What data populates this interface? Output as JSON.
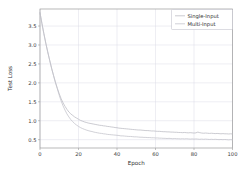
{
  "chart_data": {
    "type": "line",
    "title": "",
    "xlabel": "Epoch",
    "ylabel": "Test Loss",
    "xlim": [
      0,
      100
    ],
    "ylim": [
      0.28,
      3.95
    ],
    "xticks": [
      0,
      20,
      40,
      60,
      80,
      100
    ],
    "xticklabels": [
      "0",
      "20",
      "40",
      "60",
      "80",
      "100"
    ],
    "yticks": [
      0.5,
      1.0,
      1.5,
      2.0,
      2.5,
      3.0,
      3.5
    ],
    "yticklabels": [
      "0.5",
      "1.0",
      "1.5",
      "2.0",
      "2.5",
      "3.0",
      "3.5"
    ],
    "grid": true,
    "legend_position": "upper right",
    "legend_entries": [
      "Single-Input",
      "Multi-Input"
    ],
    "x": [
      0,
      1,
      2,
      3,
      4,
      5,
      6,
      7,
      8,
      9,
      10,
      11,
      12,
      13,
      14,
      15,
      16,
      17,
      18,
      19,
      20,
      21,
      22,
      23,
      24,
      25,
      26,
      27,
      28,
      29,
      30,
      31,
      32,
      33,
      34,
      35,
      36,
      37,
      38,
      39,
      40,
      41,
      42,
      43,
      44,
      45,
      46,
      47,
      48,
      49,
      50,
      51,
      52,
      53,
      54,
      55,
      56,
      57,
      58,
      59,
      60,
      61,
      62,
      63,
      64,
      65,
      66,
      67,
      68,
      69,
      70,
      71,
      72,
      73,
      74,
      75,
      76,
      77,
      78,
      79,
      80,
      81,
      82,
      83,
      84,
      85,
      86,
      87,
      88,
      89,
      90,
      91,
      92,
      93,
      94,
      95,
      96,
      97,
      98,
      99,
      100
    ],
    "series": [
      {
        "name": "Single-Input",
        "color": "#b9b9c2",
        "values": [
          3.85,
          3.57,
          3.3,
          3.05,
          2.82,
          2.6,
          2.39,
          2.2,
          2.02,
          1.86,
          1.71,
          1.58,
          1.47,
          1.38,
          1.3,
          1.23,
          1.18,
          1.14,
          1.1,
          1.07,
          1.04,
          1.01,
          0.99,
          0.97,
          0.955,
          0.94,
          0.93,
          0.92,
          0.91,
          0.9,
          0.89,
          0.88,
          0.875,
          0.865,
          0.86,
          0.85,
          0.845,
          0.835,
          0.83,
          0.82,
          0.815,
          0.805,
          0.8,
          0.795,
          0.79,
          0.785,
          0.78,
          0.775,
          0.77,
          0.765,
          0.76,
          0.755,
          0.755,
          0.75,
          0.745,
          0.74,
          0.74,
          0.735,
          0.73,
          0.73,
          0.725,
          0.72,
          0.72,
          0.715,
          0.71,
          0.71,
          0.705,
          0.705,
          0.7,
          0.7,
          0.695,
          0.695,
          0.69,
          0.69,
          0.685,
          0.69,
          0.685,
          0.68,
          0.685,
          0.68,
          0.675,
          0.68,
          0.7,
          0.685,
          0.675,
          0.67,
          0.675,
          0.67,
          0.665,
          0.67,
          0.665,
          0.66,
          0.665,
          0.66,
          0.655,
          0.66,
          0.655,
          0.655,
          0.65,
          0.655,
          0.65
        ]
      },
      {
        "name": "Multi-Input",
        "color": "#c2c2c9",
        "values": [
          3.85,
          3.57,
          3.3,
          3.05,
          2.82,
          2.6,
          2.39,
          2.2,
          2.01,
          1.84,
          1.67,
          1.52,
          1.39,
          1.28,
          1.18,
          1.1,
          1.03,
          0.975,
          0.925,
          0.885,
          0.85,
          0.82,
          0.795,
          0.775,
          0.755,
          0.74,
          0.725,
          0.715,
          0.7,
          0.69,
          0.68,
          0.67,
          0.665,
          0.655,
          0.65,
          0.64,
          0.635,
          0.63,
          0.625,
          0.62,
          0.615,
          0.61,
          0.6,
          0.6,
          0.595,
          0.59,
          0.585,
          0.585,
          0.58,
          0.575,
          0.575,
          0.57,
          0.565,
          0.565,
          0.56,
          0.56,
          0.555,
          0.555,
          0.55,
          0.55,
          0.545,
          0.545,
          0.54,
          0.54,
          0.535,
          0.535,
          0.53,
          0.535,
          0.53,
          0.525,
          0.53,
          0.525,
          0.525,
          0.52,
          0.525,
          0.52,
          0.525,
          0.52,
          0.515,
          0.52,
          0.515,
          0.52,
          0.515,
          0.51,
          0.515,
          0.51,
          0.515,
          0.51,
          0.505,
          0.51,
          0.505,
          0.51,
          0.505,
          0.5,
          0.505,
          0.5,
          0.505,
          0.5,
          0.495,
          0.5,
          0.495
        ]
      }
    ]
  }
}
